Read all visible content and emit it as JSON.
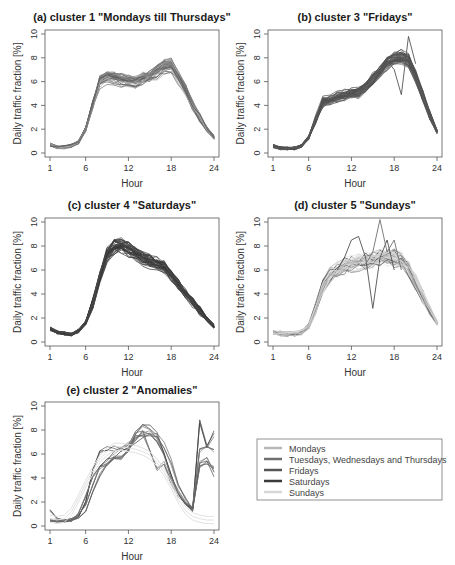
{
  "figure": {
    "ylabel": "Daily traffic fraction [%]",
    "xlabel": "Hour",
    "xticks": [
      1,
      6,
      12,
      18,
      24
    ],
    "yticks": [
      0,
      2,
      4,
      6,
      8,
      10
    ]
  },
  "legend": {
    "items": [
      {
        "label": "Mondays",
        "color": "#b8b8b8"
      },
      {
        "label": "Tuesdays, Wednesdays and Thursdays",
        "color": "#707070"
      },
      {
        "label": "Fridays",
        "color": "#555555"
      },
      {
        "label": "Saturdays",
        "color": "#3a3a3a"
      },
      {
        "label": "Sundays",
        "color": "#d8d8d8"
      }
    ]
  },
  "chart_data": [
    {
      "type": "line",
      "title": "(a) cluster 1 \"Mondays till Thursdays\"",
      "xlabel": "Hour",
      "ylabel": "Daily traffic fraction [%]",
      "xlim": [
        1,
        24
      ],
      "ylim": [
        0,
        10
      ],
      "x": [
        1,
        2,
        3,
        4,
        5,
        6,
        7,
        8,
        9,
        10,
        11,
        12,
        13,
        14,
        15,
        16,
        17,
        18,
        19,
        20,
        21,
        22,
        23,
        24
      ],
      "series": [
        {
          "name": "typical profile",
          "values": [
            0.7,
            0.5,
            0.5,
            0.6,
            0.9,
            2.0,
            4.0,
            6.0,
            6.4,
            6.3,
            6.1,
            6.0,
            6.0,
            6.2,
            6.4,
            6.8,
            7.2,
            7.3,
            6.3,
            5.2,
            4.0,
            3.0,
            2.0,
            1.3
          ]
        }
      ],
      "n_lines": 40,
      "dominant_colors": [
        "#707070",
        "#b8b8b8"
      ]
    },
    {
      "type": "line",
      "title": "(b) cluster 3 \"Fridays\"",
      "xlabel": "Hour",
      "ylabel": "Daily traffic fraction [%]",
      "xlim": [
        1,
        24
      ],
      "ylim": [
        0,
        10
      ],
      "x": [
        1,
        2,
        3,
        4,
        5,
        6,
        7,
        8,
        9,
        10,
        11,
        12,
        13,
        14,
        15,
        16,
        17,
        18,
        19,
        20,
        21,
        22,
        23,
        24
      ],
      "series": [
        {
          "name": "typical profile",
          "values": [
            0.6,
            0.4,
            0.4,
            0.4,
            0.6,
            1.3,
            2.8,
            4.3,
            4.5,
            4.7,
            4.9,
            5.0,
            5.1,
            5.6,
            6.2,
            6.9,
            7.6,
            8.0,
            8.1,
            7.8,
            6.5,
            4.8,
            3.2,
            1.8
          ]
        }
      ],
      "n_lines": 40,
      "dominant_colors": [
        "#555555"
      ]
    },
    {
      "type": "line",
      "title": "(c) cluster 4 \"Saturdays\"",
      "xlabel": "Hour",
      "ylabel": "Daily traffic fraction [%]",
      "xlim": [
        1,
        24
      ],
      "ylim": [
        0,
        10
      ],
      "x": [
        1,
        2,
        3,
        4,
        5,
        6,
        7,
        8,
        9,
        10,
        11,
        12,
        13,
        14,
        15,
        16,
        17,
        18,
        19,
        20,
        21,
        22,
        23,
        24
      ],
      "series": [
        {
          "name": "typical profile",
          "values": [
            1.1,
            0.8,
            0.7,
            0.6,
            0.9,
            1.6,
            3.2,
            5.4,
            7.2,
            7.9,
            8.0,
            7.7,
            7.3,
            7.0,
            6.7,
            6.5,
            6.2,
            5.6,
            4.8,
            4.0,
            3.3,
            2.6,
            1.9,
            1.3
          ]
        }
      ],
      "n_lines": 40,
      "dominant_colors": [
        "#3a3a3a"
      ]
    },
    {
      "type": "line",
      "title": "(d) cluster 5 \"Sundays\"",
      "xlabel": "Hour",
      "ylabel": "Daily traffic fraction [%]",
      "xlim": [
        1,
        24
      ],
      "ylim": [
        0,
        10
      ],
      "x": [
        1,
        2,
        3,
        4,
        5,
        6,
        7,
        8,
        9,
        10,
        11,
        12,
        13,
        14,
        15,
        16,
        17,
        18,
        19,
        20,
        21,
        22,
        23,
        24
      ],
      "series": [
        {
          "name": "typical profile",
          "values": [
            0.8,
            0.7,
            0.7,
            0.7,
            0.8,
            1.3,
            2.8,
            4.6,
            5.5,
            6.0,
            6.3,
            6.5,
            6.6,
            6.7,
            6.8,
            7.0,
            7.1,
            7.0,
            6.7,
            6.0,
            5.0,
            3.8,
            2.6,
            1.6
          ]
        }
      ],
      "n_lines": 40,
      "dominant_colors": [
        "#d8d8d8",
        "#707070"
      ]
    },
    {
      "type": "line",
      "title": "(e) cluster 2 \"Anomalies\"",
      "xlabel": "Hour",
      "ylabel": "Daily traffic fraction [%]",
      "xlim": [
        1,
        24
      ],
      "ylim": [
        0,
        10
      ],
      "x": [
        1,
        2,
        3,
        4,
        5,
        6,
        7,
        8,
        9,
        10,
        11,
        12,
        13,
        14,
        15,
        16,
        17,
        18,
        19,
        20,
        21,
        22,
        23,
        24
      ],
      "series": [
        {
          "name": "anomaly 1",
          "values": [
            0.5,
            0.4,
            0.4,
            0.5,
            0.8,
            2.0,
            4.5,
            6.0,
            6.3,
            6.4,
            6.2,
            6.5,
            7.5,
            8.3,
            8.0,
            7.4,
            6.0,
            4.0,
            2.5,
            1.8,
            1.2,
            8.5,
            6.5,
            7.5
          ]
        },
        {
          "name": "anomaly 2",
          "values": [
            1.3,
            0.7,
            0.5,
            0.6,
            0.9,
            1.8,
            3.5,
            5.0,
            5.5,
            6.0,
            6.5,
            6.8,
            7.2,
            7.6,
            7.8,
            7.2,
            6.0,
            4.2,
            2.8,
            2.0,
            1.4,
            5.0,
            5.2,
            5.0
          ]
        },
        {
          "name": "anomaly 3",
          "values": [
            0.4,
            0.5,
            0.4,
            0.4,
            1.0,
            2.5,
            4.0,
            4.6,
            5.0,
            5.3,
            5.5,
            6.0,
            7.0,
            7.5,
            6.0,
            4.5,
            5.0,
            3.5,
            2.5,
            1.8,
            1.5,
            6.0,
            6.3,
            6.0
          ]
        },
        {
          "name": "anomaly 4",
          "values": [
            0.5,
            0.4,
            0.4,
            0.5,
            0.7,
            1.3,
            3.0,
            4.5,
            5.5,
            6.0,
            6.0,
            6.5,
            7.8,
            8.0,
            8.0,
            7.8,
            7.0,
            5.5,
            3.5,
            2.5,
            1.5,
            5.5,
            5.8,
            4.5
          ]
        }
      ],
      "n_lines": 10,
      "dominant_colors": [
        "#707070",
        "#555555",
        "#d8d8d8"
      ]
    }
  ]
}
